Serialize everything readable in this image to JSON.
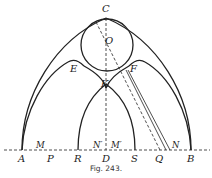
{
  "figure": {
    "caption": "Fig. 243.",
    "labels": {
      "C": "C",
      "O": "O",
      "E": "E",
      "F": "F",
      "K": "K",
      "A": "A",
      "M": "M",
      "P": "P",
      "R": "R",
      "N1": "N′",
      "D": "D",
      "M1": "M′",
      "S": "S",
      "Q": "Q",
      "N": "N",
      "B": "B"
    },
    "colors": {
      "ink": "#222222",
      "background": "#ffffff"
    }
  }
}
